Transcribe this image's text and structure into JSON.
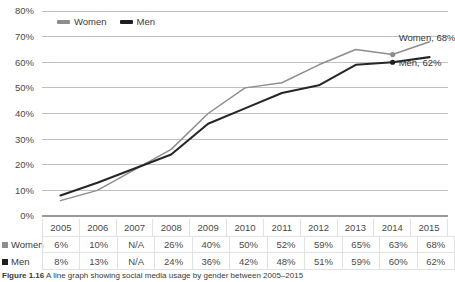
{
  "chart_data": {
    "type": "line",
    "title": "",
    "xlabel": "",
    "ylabel": "",
    "ylim": [
      0,
      80
    ],
    "grid": true,
    "legend_position": "top-left",
    "categories": [
      "2005",
      "2006",
      "2007",
      "2008",
      "2009",
      "2010",
      "2011",
      "2012",
      "2013",
      "2014",
      "2015"
    ],
    "yticks": [
      "0%",
      "10%",
      "20%",
      "30%",
      "40%",
      "50%",
      "60%",
      "70%",
      "80%"
    ],
    "series": [
      {
        "name": "Women",
        "color": "#8d8d8d",
        "values": [
          6,
          10,
          null,
          26,
          40,
          50,
          52,
          59,
          65,
          63,
          68
        ],
        "display_values": [
          "6%",
          "10%",
          "N/A",
          "26%",
          "40%",
          "50%",
          "52%",
          "59%",
          "65%",
          "63%",
          "68%"
        ],
        "end_label": "Women, 68%"
      },
      {
        "name": "Men",
        "color": "#1f1f1f",
        "values": [
          8,
          13,
          null,
          24,
          36,
          42,
          48,
          51,
          59,
          60,
          62
        ],
        "display_values": [
          "8%",
          "13%",
          "N/A",
          "24%",
          "36%",
          "42%",
          "48%",
          "51%",
          "59%",
          "60%",
          "62%"
        ],
        "end_label": "Men, 62%"
      }
    ]
  },
  "legend": {
    "items": [
      {
        "label": "Women",
        "color": "#8d8d8d"
      },
      {
        "label": "Men",
        "color": "#1f1f1f"
      }
    ]
  },
  "table": {
    "header": [
      "2005",
      "2006",
      "2007",
      "2008",
      "2009",
      "2010",
      "2011",
      "2012",
      "2013",
      "2014",
      "2015"
    ],
    "rows": [
      {
        "label": "Women",
        "values": [
          "6%",
          "10%",
          "N/A",
          "26%",
          "40%",
          "50%",
          "52%",
          "59%",
          "65%",
          "63%",
          "68%"
        ]
      },
      {
        "label": "Men",
        "values": [
          "8%",
          "13%",
          "N/A",
          "24%",
          "36%",
          "42%",
          "48%",
          "51%",
          "59%",
          "60%",
          "62%"
        ]
      }
    ]
  },
  "caption": {
    "label": "Figure 1.16",
    "text": "A line graph showing social media usage by gender between 2005–2015"
  },
  "annotations": {
    "women_end": "Women, 68%",
    "men_end": "Men, 62%"
  }
}
